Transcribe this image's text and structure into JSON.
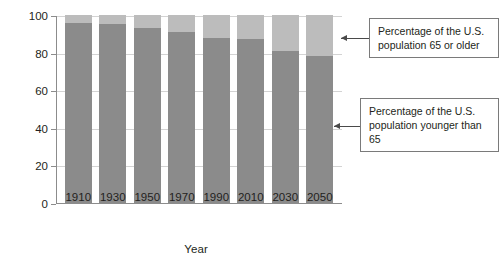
{
  "chart_data": {
    "type": "bar",
    "stacked": true,
    "title": "",
    "xlabel": "Year",
    "ylabel": "Percentage",
    "categories": [
      "1910",
      "1930",
      "1950",
      "1970",
      "1990",
      "2010",
      "2030",
      "2050"
    ],
    "ylim": [
      0,
      100
    ],
    "yticks": [
      0,
      20,
      40,
      60,
      80,
      100
    ],
    "ytick_labels": [
      "0",
      "20",
      "40",
      "60",
      "80",
      "100"
    ],
    "grid": true,
    "legend_position": "annotation-callouts",
    "series": [
      {
        "name": "Percentage of the U.S. population younger than 65",
        "color": "#8b8b8b",
        "values": [
          96,
          95,
          93,
          91,
          88,
          87,
          81,
          78
        ]
      },
      {
        "name": "Percentage of the U.S. population 65 or older",
        "color": "#bcbcbc",
        "values": [
          4,
          5,
          7,
          9,
          12,
          13,
          19,
          22
        ]
      }
    ],
    "annotations": [
      {
        "id": "older",
        "text": "Percentage of the U.S. population 65 or older",
        "target_series": "Percentage of the U.S. population 65 or older"
      },
      {
        "id": "younger",
        "text": "Percentage of the U.S. population younger than 65",
        "target_series": "Percentage of the U.S. population younger than 65"
      }
    ]
  },
  "axes": {
    "y_title": "Percentage",
    "x_title": "Year"
  },
  "colors": {
    "series_younger": "#8b8b8b",
    "series_older": "#bcbcbc",
    "axis": "#8c8c8c",
    "grid": "#d3d3d3",
    "text": "#231f20",
    "callout_border": "#7a7a7a"
  }
}
